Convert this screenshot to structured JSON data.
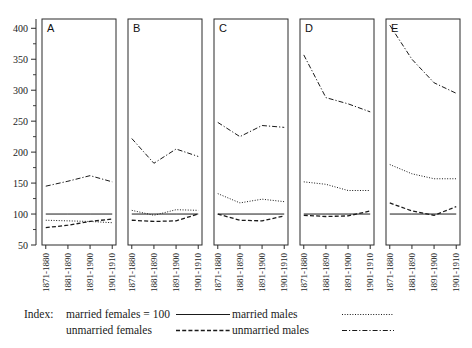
{
  "chart_data": {
    "type": "line",
    "title": "",
    "subtitle": "",
    "xlabel": "",
    "ylabel": "",
    "ylim": [
      50,
      415
    ],
    "yticks": [
      50,
      100,
      150,
      200,
      250,
      300,
      350,
      400
    ],
    "ytick_labels": [
      "50",
      "100",
      "150",
      "200",
      "250",
      "300",
      "350",
      "400"
    ],
    "yminor_step": 25,
    "grid": false,
    "legend_position": "bottom",
    "categories": [
      "1871-1880",
      "1881-1890",
      "1891-1900",
      "1901-1910"
    ],
    "reference_line": {
      "value": 100,
      "label": "married females = 100",
      "style": "solid"
    },
    "panels": [
      {
        "label": "A",
        "series": [
          {
            "name": "married females",
            "style": "solid",
            "values": [
              100,
              100,
              100,
              100
            ]
          },
          {
            "name": "married males",
            "style": "dotted",
            "values": [
              90,
              89,
              88,
              86
            ]
          },
          {
            "name": "unmarried females",
            "style": "dashed",
            "values": [
              78,
              82,
              88,
              92
            ]
          },
          {
            "name": "unmarried males",
            "style": "dashdot",
            "values": [
              145,
              153,
              162,
              152
            ]
          }
        ]
      },
      {
        "label": "B",
        "series": [
          {
            "name": "married females",
            "style": "solid",
            "values": [
              100,
              100,
              100,
              100
            ]
          },
          {
            "name": "married males",
            "style": "dotted",
            "values": [
              106,
              98,
              107,
              106
            ]
          },
          {
            "name": "unmarried females",
            "style": "dashed",
            "values": [
              90,
              88,
              89,
              100
            ]
          },
          {
            "name": "unmarried males",
            "style": "dashdot",
            "values": [
              222,
              182,
              205,
              193
            ]
          }
        ]
      },
      {
        "label": "C",
        "series": [
          {
            "name": "married females",
            "style": "solid",
            "values": [
              100,
              100,
              100,
              100
            ]
          },
          {
            "name": "married males",
            "style": "dotted",
            "values": [
              133,
              118,
              124,
              120
            ]
          },
          {
            "name": "unmarried females",
            "style": "dashed",
            "values": [
              100,
              90,
              89,
              97
            ]
          },
          {
            "name": "unmarried males",
            "style": "dashdot",
            "values": [
              248,
              225,
              243,
              240
            ]
          }
        ]
      },
      {
        "label": "D",
        "series": [
          {
            "name": "married females",
            "style": "solid",
            "values": [
              100,
              100,
              100,
              100
            ]
          },
          {
            "name": "married males",
            "style": "dotted",
            "values": [
              152,
              148,
              138,
              138
            ]
          },
          {
            "name": "unmarried females",
            "style": "dashed",
            "values": [
              98,
              96,
              97,
              105
            ]
          },
          {
            "name": "unmarried males",
            "style": "dashdot",
            "values": [
              357,
              288,
              278,
              265
            ]
          }
        ]
      },
      {
        "label": "E",
        "series": [
          {
            "name": "married females",
            "style": "solid",
            "values": [
              100,
              100,
              100,
              100
            ]
          },
          {
            "name": "married males",
            "style": "dotted",
            "values": [
              180,
              165,
              157,
              157
            ]
          },
          {
            "name": "unmarried females",
            "style": "dashed",
            "values": [
              118,
              105,
              98,
              112
            ]
          },
          {
            "name": "unmarried males",
            "style": "dashdot",
            "values": [
              405,
              350,
              312,
              295
            ]
          }
        ]
      }
    ]
  },
  "legend": {
    "index_prefix": "Index:",
    "entries": [
      {
        "label": "married females  =  100",
        "style": "solid",
        "column": "left",
        "row": 0
      },
      {
        "label": "unmarried females",
        "style": "dashed",
        "column": "left",
        "row": 1
      },
      {
        "label": "married males",
        "style": "dotted",
        "column": "right",
        "row": 0
      },
      {
        "label": "unmarried males",
        "style": "dashdot",
        "column": "right",
        "row": 1
      }
    ]
  },
  "colors": {
    "ink": "#1a1a1a",
    "frame": "#2b2b2b",
    "background": "#ffffff"
  }
}
